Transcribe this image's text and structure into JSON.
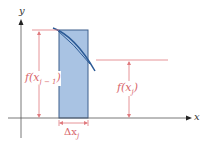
{
  "diagram": {
    "axes": {
      "x_label": "x",
      "y_label": "y"
    },
    "labels": {
      "f_prev": "f(x",
      "f_prev_sub": "j − 1",
      "f_prev_close": ")",
      "f_curr": "f(x",
      "f_curr_sub": "j",
      "f_curr_close": ")",
      "delta": "Δx",
      "delta_sub": "j"
    },
    "colors": {
      "rect_fill": "#a9c3e3",
      "rect_stroke": "#3d5f8c",
      "curve": "#2b5a96",
      "annotation": "#e07a7e",
      "axis": "#444444"
    }
  }
}
